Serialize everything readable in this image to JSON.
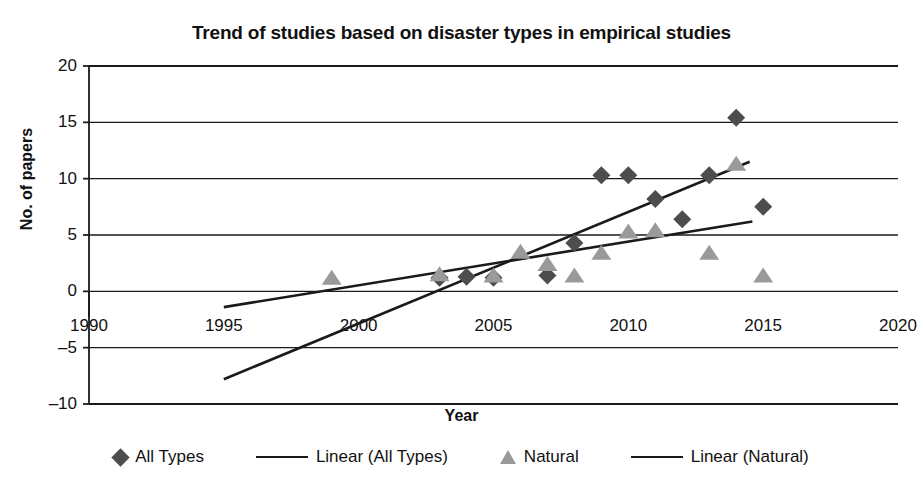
{
  "chart_data": {
    "type": "scatter",
    "title": "Trend of studies based on disaster types in empirical studies",
    "xlabel": "Year",
    "ylabel": "No. of papers",
    "xlim": [
      1990,
      2020
    ],
    "ylim": [
      -10,
      20
    ],
    "xticks": [
      1990,
      1995,
      2000,
      2005,
      2010,
      2015,
      2020
    ],
    "yticks": [
      20,
      15,
      10,
      5,
      0,
      -5,
      -10
    ],
    "grid": "horizontal",
    "legend_position": "bottom",
    "series": [
      {
        "name": "All Types",
        "marker": "diamond",
        "color": "#4d4d4d",
        "points": [
          {
            "x": 2003,
            "y": 1.2
          },
          {
            "x": 2004,
            "y": 1.3
          },
          {
            "x": 2005,
            "y": 1.2
          },
          {
            "x": 2007,
            "y": 1.4
          },
          {
            "x": 2008,
            "y": 4.3
          },
          {
            "x": 2009,
            "y": 10.3
          },
          {
            "x": 2010,
            "y": 10.3
          },
          {
            "x": 2011,
            "y": 8.2
          },
          {
            "x": 2012,
            "y": 6.4
          },
          {
            "x": 2013,
            "y": 10.3
          },
          {
            "x": 2014,
            "y": 15.4
          },
          {
            "x": 2015,
            "y": 7.5
          }
        ]
      },
      {
        "name": "Natural",
        "marker": "triangle",
        "color": "#9a9a9a",
        "points": [
          {
            "x": 1999,
            "y": 1.1
          },
          {
            "x": 2003,
            "y": 1.4
          },
          {
            "x": 2005,
            "y": 1.3
          },
          {
            "x": 2006,
            "y": 3.4
          },
          {
            "x": 2007,
            "y": 2.3
          },
          {
            "x": 2008,
            "y": 1.3
          },
          {
            "x": 2009,
            "y": 3.3
          },
          {
            "x": 2010,
            "y": 5.2
          },
          {
            "x": 2011,
            "y": 5.3
          },
          {
            "x": 2013,
            "y": 3.3
          },
          {
            "x": 2014,
            "y": 11.2
          },
          {
            "x": 2015,
            "y": 1.3
          }
        ]
      }
    ],
    "trendlines": [
      {
        "name": "Linear (All Types)",
        "color": "#1a1a1a",
        "x0": 1995,
        "y0": -7.8,
        "x1": 2014.5,
        "y1": 11.5
      },
      {
        "name": "Linear (Natural)",
        "color": "#1a1a1a",
        "x0": 1995,
        "y0": -1.4,
        "x1": 2014.6,
        "y1": 6.2
      }
    ]
  },
  "legend": {
    "items": [
      {
        "label": "All Types",
        "icon": "diamond-marker-icon"
      },
      {
        "label": "Linear (All Types)",
        "icon": "line-swatch-icon"
      },
      {
        "label": "Natural",
        "icon": "triangle-marker-icon"
      },
      {
        "label": "Linear (Natural)",
        "icon": "line-swatch-icon"
      }
    ]
  }
}
